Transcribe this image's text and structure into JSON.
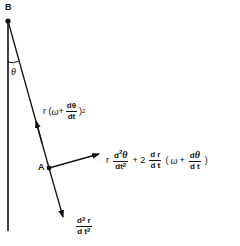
{
  "diagram": {
    "points": {
      "B": {
        "label": "B",
        "x": 8,
        "y": 21
      },
      "A": {
        "label": "A",
        "x": 49,
        "y": 168
      }
    },
    "angle_label": "θ",
    "vectors": {
      "radial_inward": {
        "expr": {
          "prefix": "r ( ",
          "omega": "ω",
          "plus": " + ",
          "num": "dθ",
          "den": "dt",
          "suffix": ")",
          "power": "2"
        }
      },
      "tangential": {
        "expr": {
          "r": "r",
          "frac1_num": "d",
          "frac1_num_sup": "2",
          "frac1_num_sym": "θ",
          "frac1_den": "dt",
          "frac1_den_sup": "2",
          "plus2": "+ 2",
          "frac2_num": "d r",
          "frac2_den": "d t",
          "open": "(",
          "omega": "ω",
          "plus": "+",
          "frac3_num": "d",
          "frac3_num_sym": "θ",
          "frac3_den": "d t",
          "close": ")"
        }
      },
      "radial_outward": {
        "expr": {
          "num": "d",
          "num_sup": "2",
          "num_r": " r",
          "den": "d t",
          "den_sup": "2"
        }
      }
    },
    "colors": {
      "ink": "#111111",
      "background": "#ffffff"
    }
  }
}
